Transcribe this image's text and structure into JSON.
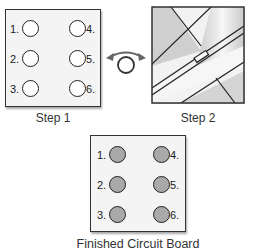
{
  "step1": {
    "caption": "Step 1",
    "pads": [
      {
        "label": "1.",
        "side": "left",
        "filled": false
      },
      {
        "label": "2.",
        "side": "left",
        "filled": false
      },
      {
        "label": "3.",
        "side": "left",
        "filled": false
      },
      {
        "label": "4.",
        "side": "right",
        "filled": false
      },
      {
        "label": "5.",
        "side": "right",
        "filled": false
      },
      {
        "label": "6.",
        "side": "right",
        "filled": false
      }
    ]
  },
  "flip_arrow": {
    "icon": "flip-rotate-arrow-icon"
  },
  "step2": {
    "caption": "Step 2",
    "description": "Board flipped over showing diagonal copper traces"
  },
  "finished": {
    "caption": "Finished Circuit Board",
    "pads": [
      {
        "label": "1.",
        "side": "left",
        "filled": true
      },
      {
        "label": "2.",
        "side": "left",
        "filled": true
      },
      {
        "label": "3.",
        "side": "left",
        "filled": true
      },
      {
        "label": "4.",
        "side": "right",
        "filled": true
      },
      {
        "label": "5.",
        "side": "right",
        "filled": true
      },
      {
        "label": "6.",
        "side": "right",
        "filled": true
      }
    ]
  },
  "colors": {
    "board_fill": "#f4f4f4",
    "pad_filled": "#a9a9a9",
    "trace_shade": "#c8c8c8",
    "outline": "#222222"
  }
}
